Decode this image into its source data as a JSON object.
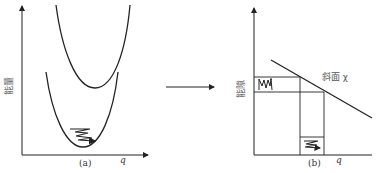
{
  "panel_a": {
    "y_label": "能量",
    "x_label": "q",
    "caption": "(a)"
  },
  "arrow": {
    "direction": "right"
  },
  "panel_b": {
    "y_label": "能隙",
    "x_label": "q",
    "caption": "(b)",
    "slope_label": "斜面 χ"
  },
  "colors": {
    "line": "#222222",
    "text": "#333333",
    "background": "#ffffff"
  }
}
